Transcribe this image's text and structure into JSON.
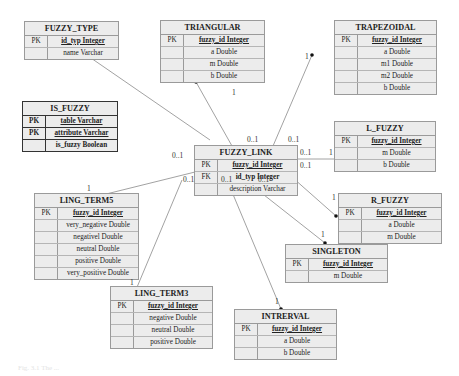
{
  "entities": {
    "fuzzy_type": {
      "title": "FUZZY_TYPE",
      "rows": [
        {
          "key": "PK",
          "field": "id_typ Integer"
        },
        {
          "key": "",
          "field": "name Varchar"
        }
      ]
    },
    "triangular": {
      "title": "TRIANGULAR",
      "rows": [
        {
          "key": "PK",
          "field": "fuzzy_id Integer"
        },
        {
          "key": "",
          "field": "a Double"
        },
        {
          "key": "",
          "field": "m Double"
        },
        {
          "key": "",
          "field": "b Double"
        }
      ]
    },
    "trapezoidal": {
      "title": "TRAPEZOIDAL",
      "rows": [
        {
          "key": "PK",
          "field": "fuzzy_id Integer"
        },
        {
          "key": "",
          "field": "a Double"
        },
        {
          "key": "",
          "field": "m1 Double"
        },
        {
          "key": "",
          "field": "m2 Double"
        },
        {
          "key": "",
          "field": "b Double"
        }
      ]
    },
    "is_fuzzy": {
      "title": "IS_FUZZY",
      "rows": [
        {
          "key": "PK",
          "field": "table Varchar"
        },
        {
          "key": "PK",
          "field": "attribute Varchar"
        },
        {
          "key": "",
          "field": "is_fuzzy Boolean"
        }
      ]
    },
    "fuzzy_link": {
      "title": "FUZZY_LINK",
      "rows": [
        {
          "key": "PK",
          "field": "fuzzy_id Integer"
        },
        {
          "key": "FK",
          "field": "id_typ Integer"
        },
        {
          "key": "",
          "field": "description Varchar"
        }
      ]
    },
    "l_fuzzy": {
      "title": "L_FUZZY",
      "rows": [
        {
          "key": "PK",
          "field": "fuzzy_id Integer"
        },
        {
          "key": "",
          "field": "m Double"
        },
        {
          "key": "",
          "field": "b Double"
        }
      ]
    },
    "ling_term5": {
      "title": "LING_TERM5",
      "rows": [
        {
          "key": "PK",
          "field": "fuzzy_id Integer"
        },
        {
          "key": "",
          "field": "very_negative Double"
        },
        {
          "key": "",
          "field": "negativel Double"
        },
        {
          "key": "",
          "field": "neutral Double"
        },
        {
          "key": "",
          "field": "positive Double"
        },
        {
          "key": "",
          "field": "very_positive Double"
        }
      ]
    },
    "r_fuzzy": {
      "title": "R_FUZZY",
      "rows": [
        {
          "key": "PK",
          "field": "fuzzy_id Integer"
        },
        {
          "key": "",
          "field": "a Double"
        },
        {
          "key": "",
          "field": "m Double"
        }
      ]
    },
    "singleton": {
      "title": "SINGLETON",
      "rows": [
        {
          "key": "PK",
          "field": "fuzzy_id Integer"
        },
        {
          "key": "",
          "field": "m Double"
        }
      ]
    },
    "ling_term3": {
      "title": "LING_TERM3",
      "rows": [
        {
          "key": "PK",
          "field": "fuzzy_id Integer"
        },
        {
          "key": "",
          "field": "negative Double"
        },
        {
          "key": "",
          "field": "neutral Double"
        },
        {
          "key": "",
          "field": "positive Double"
        }
      ]
    },
    "intrerval": {
      "title": "INTRERVAL",
      "rows": [
        {
          "key": "PK",
          "field": "fuzzy_id Integer"
        },
        {
          "key": "",
          "field": "a Double"
        },
        {
          "key": "",
          "field": "b Double"
        }
      ]
    }
  },
  "cardinalities": {
    "triangular_one": "1",
    "triangular_many": "0..1",
    "trapezoidal_one": "1",
    "trapezoidal_many": "0..1",
    "l_fuzzy_one": "1",
    "l_fuzzy_many": "0..1",
    "r_fuzzy_one": "1",
    "r_fuzzy_many": "0..1",
    "singleton_one": "1",
    "singleton_many": "0..1",
    "intrerval_one": "1",
    "intrerval_many": "0..1",
    "ling_term3_one": "1",
    "ling_term3_many": "0..1",
    "ling_term5_one": "1",
    "ling_term5_many": "0..1"
  },
  "caption": "Fig. 3.1 The ..."
}
